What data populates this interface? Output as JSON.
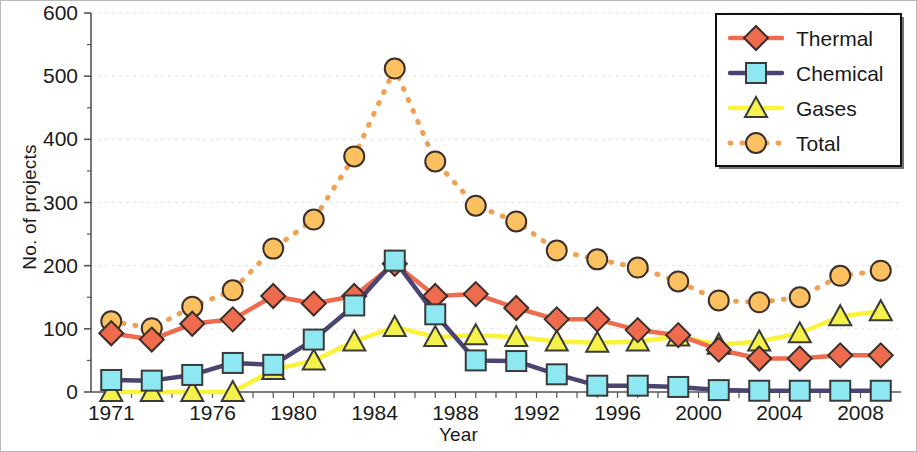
{
  "chart_data": {
    "type": "line",
    "title": "",
    "xlabel": "Year",
    "ylabel": "No. of projects",
    "xlim": [
      1970,
      2010
    ],
    "ylim": [
      0,
      600
    ],
    "ytick_values": [
      0,
      100,
      200,
      300,
      400,
      500,
      600
    ],
    "ytick_labels": [
      "0",
      "100",
      "200",
      "300",
      "400",
      "500",
      "600"
    ],
    "xtick_labels": [
      "1971",
      "1976",
      "1980",
      "1984",
      "1988",
      "1992",
      "1996",
      "2000",
      "2004",
      "2008"
    ],
    "xtick_values": [
      1971,
      1976,
      1980,
      1984,
      1988,
      1992,
      1996,
      2000,
      2004,
      2008
    ],
    "grid": "horizontal-faint",
    "legend_position": "top-right",
    "x": [
      1971,
      1973,
      1975,
      1977,
      1979,
      1981,
      1983,
      1985,
      1987,
      1989,
      1991,
      1993,
      1995,
      1997,
      1999,
      2001,
      2003,
      2005,
      2007,
      2009
    ],
    "series": [
      {
        "name": "Thermal",
        "marker": "diamond",
        "line_color": "#ef6b4e",
        "marker_fill": "#ef6b4e",
        "marker_edge": "#3a2f2a",
        "line_style": "solid",
        "values": [
          93,
          83,
          108,
          115,
          152,
          140,
          152,
          203,
          152,
          155,
          133,
          115,
          115,
          98,
          90,
          67,
          53,
          53,
          58,
          58
        ]
      },
      {
        "name": "Chemical",
        "marker": "square",
        "line_color": "#4a4472",
        "marker_fill": "#8ee8f2",
        "marker_edge": "#3a3a3a",
        "line_style": "solid",
        "values": [
          19,
          18,
          27,
          46,
          43,
          83,
          137,
          208,
          123,
          50,
          49,
          28,
          10,
          10,
          8,
          3,
          2,
          2,
          2,
          2
        ]
      },
      {
        "name": "Gases",
        "marker": "triangle",
        "line_color": "#fbf23a",
        "marker_fill": "#f4f24a",
        "marker_edge": "#3a3a3a",
        "line_style": "solid",
        "values": [
          0,
          0,
          0,
          0,
          35,
          50,
          80,
          103,
          87,
          90,
          87,
          80,
          78,
          80,
          88,
          75,
          80,
          93,
          120,
          128
        ]
      },
      {
        "name": "Total",
        "marker": "circle",
        "line_color": "#f0a050",
        "marker_fill": "#fbc060",
        "marker_edge": "#3a2f2a",
        "line_style": "dotted",
        "values": [
          112,
          101,
          135,
          161,
          227,
          273,
          373,
          512,
          365,
          295,
          270,
          224,
          210,
          197,
          175,
          145,
          142,
          150,
          184,
          192
        ]
      }
    ]
  },
  "legend": {
    "items": [
      {
        "label": "Thermal"
      },
      {
        "label": "Chemical"
      },
      {
        "label": "Gases"
      },
      {
        "label": "Total"
      }
    ]
  },
  "colors": {
    "thermal": "#ef6b4e",
    "chemical_line": "#4a4472",
    "chemical_marker": "#8ee8f2",
    "gases": "#f4f24a",
    "total": "#f0a050",
    "axis": "#555555",
    "grid": "#e6e0e0",
    "text": "#1a1a1a"
  }
}
